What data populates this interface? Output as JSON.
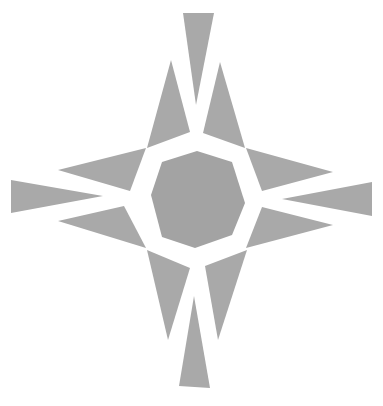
{
  "emblem": {
    "name": "compass-star-emblem",
    "fill_color": "#a9a9a9",
    "center_color": "#a3a3a3",
    "background": "#ffffff",
    "shapes": {
      "center_octagon": "197,151 232,162 245,203 232,235 195,248 162,237 151,195 162,162",
      "top_spike": "183,13 214,13 196,105",
      "bottom_spike": "194,296 210,388 179,386",
      "left_spike": "11,180 103,196 11,213",
      "right_spike": "372,182 372,216 282,199",
      "upper_left_top": "171,60 190,132 147,148",
      "upper_right_top": "220,62 245,148 203,133",
      "upper_left_side": "58,170 146,148 130,191",
      "upper_right_side": "333,172 262,191 246,148",
      "lower_left_side": "58,221 124,206 146,248",
      "lower_right_side": "333,225 246,248 262,207",
      "lower_left_bottom": "147,250 190,268 168,340",
      "lower_right_bottom": "205,266 247,250 218,340"
    }
  }
}
